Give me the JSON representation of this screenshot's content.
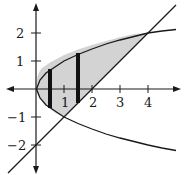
{
  "diagram": {
    "curves": [
      {
        "name": "parabola",
        "equation": "y^2 = x"
      },
      {
        "name": "line",
        "equation": "y = x - 2"
      }
    ],
    "intersections": [
      [
        1,
        -1
      ],
      [
        4,
        2
      ]
    ],
    "shaded_region": {
      "between": [
        "parabola",
        "line"
      ],
      "x_range": [
        0,
        4
      ],
      "fill": "#d3d3d3"
    },
    "strips_x": [
      0.5,
      1.5
    ],
    "x_ticks": [
      {
        "value": 1,
        "label": "1"
      },
      {
        "value": 2,
        "label": "2"
      },
      {
        "value": 3,
        "label": "3"
      },
      {
        "value": 4,
        "label": "4"
      }
    ],
    "y_ticks": [
      {
        "value": 2,
        "label": "2"
      },
      {
        "value": 1,
        "label": "1"
      },
      {
        "value": -1,
        "label": "−1"
      },
      {
        "value": -2,
        "label": "−2"
      }
    ],
    "colors": {
      "stroke": "#1a1a1a",
      "shade": "#d3d3d3"
    }
  }
}
